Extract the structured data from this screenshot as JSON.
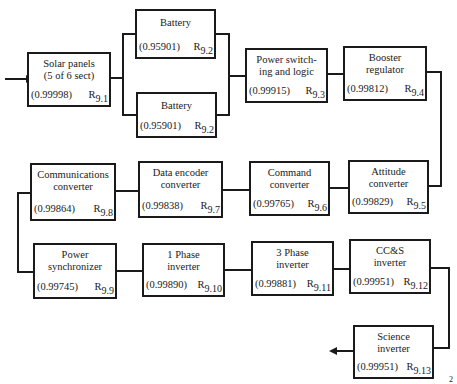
{
  "diagram": {
    "type": "reliability-block-diagram",
    "blocks": [
      {
        "id": "r9_1",
        "name": "Solar panels\n(5 of 6 sect)",
        "reliability": "(0.99998)",
        "label": "R",
        "sub": "9.1"
      },
      {
        "id": "r9_2a",
        "name": "Battery",
        "reliability": "(0.95901)",
        "label": "R",
        "sub": "9.2"
      },
      {
        "id": "r9_2b",
        "name": "Battery",
        "reliability": "(0.95901)",
        "label": "R",
        "sub": "9.2"
      },
      {
        "id": "r9_3",
        "name": "Power switch-\ning and logic",
        "reliability": "(0.99915)",
        "label": "R",
        "sub": "9.3"
      },
      {
        "id": "r9_4",
        "name": "Booster\nregulator",
        "reliability": "(0.99812)",
        "label": "R",
        "sub": "9.4"
      },
      {
        "id": "r9_5",
        "name": "Attitude\nconverter",
        "reliability": "(0.99829)",
        "label": "R",
        "sub": "9.5"
      },
      {
        "id": "r9_6",
        "name": "Command\nconverter",
        "reliability": "(0.99765)",
        "label": "R",
        "sub": "9.6"
      },
      {
        "id": "r9_7",
        "name": "Data encoder\nconverter",
        "reliability": "(0.99838)",
        "label": "R",
        "sub": "9.7"
      },
      {
        "id": "r9_8",
        "name": "Communications\nconverter",
        "reliability": "(0.99864)",
        "label": "R",
        "sub": "9.8"
      },
      {
        "id": "r9_9",
        "name": "Power\nsynchronizer",
        "reliability": "(0.99745)",
        "label": "R",
        "sub": "9.9"
      },
      {
        "id": "r9_10",
        "name": "1 Phase\ninverter",
        "reliability": "(0.99890)",
        "label": "R",
        "sub": "9.10"
      },
      {
        "id": "r9_11",
        "name": "3 Phase\ninverter",
        "reliability": "(0.99881)",
        "label": "R",
        "sub": "9.11"
      },
      {
        "id": "r9_12",
        "name": "CC&S\ninverter",
        "reliability": "(0.99951)",
        "label": "R",
        "sub": "9.12"
      },
      {
        "id": "r9_13",
        "name": "Science\ninverter",
        "reliability": "(0.99951)",
        "label": "R",
        "sub": "9.13"
      }
    ],
    "edges": [
      [
        "input",
        "r9_1"
      ],
      [
        "r9_1",
        "r9_2a"
      ],
      [
        "r9_1",
        "r9_2b"
      ],
      [
        "r9_2a",
        "r9_3"
      ],
      [
        "r9_2b",
        "r9_3"
      ],
      [
        "r9_3",
        "r9_4"
      ],
      [
        "r9_4",
        "r9_5"
      ],
      [
        "r9_5",
        "r9_6"
      ],
      [
        "r9_6",
        "r9_7"
      ],
      [
        "r9_7",
        "r9_8"
      ],
      [
        "r9_8",
        "r9_9"
      ],
      [
        "r9_9",
        "r9_10"
      ],
      [
        "r9_10",
        "r9_11"
      ],
      [
        "r9_11",
        "r9_12"
      ],
      [
        "r9_12",
        "r9_13"
      ],
      [
        "r9_13",
        "output"
      ]
    ],
    "page_mark": "2"
  }
}
